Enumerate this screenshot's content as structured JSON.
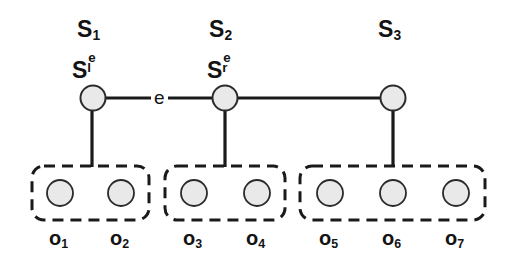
{
  "figure": {
    "background_color": "#ffffff",
    "stroke_color": "#1a1a1a",
    "node_fill_color": "#e9e9e9",
    "node_stroke_color": "#2b2b2b"
  },
  "top_nodes": [
    {
      "id": "node-1",
      "set_label": "S",
      "set_sub": "1",
      "inner_label": "S",
      "inner_sub": "l",
      "inner_sup": "e",
      "cx": 93,
      "cy": 98,
      "r": 12.5
    },
    {
      "id": "node-2",
      "set_label": "S",
      "set_sub": "2",
      "inner_label": "S",
      "inner_sub": "r",
      "inner_sup": "e",
      "cx": 225,
      "cy": 98,
      "r": 12.5
    },
    {
      "id": "node-3",
      "set_label": "S",
      "set_sub": "3",
      "inner_label": "",
      "inner_sub": "",
      "inner_sup": "",
      "cx": 393,
      "cy": 98,
      "r": 12.5
    }
  ],
  "edges": [
    {
      "id": "edge-1-2",
      "label": "e",
      "from": "node-1",
      "to": "node-2",
      "label_x": 158,
      "label_y": 98
    },
    {
      "id": "edge-2-3",
      "label": "",
      "from": "node-2",
      "to": "node-3"
    }
  ],
  "groups": [
    {
      "id": "group-1",
      "x": 32,
      "y": 166,
      "width": 117,
      "height": 54,
      "connector_x": 92,
      "leaves": [
        {
          "label": "o",
          "sub": "1",
          "cx": 60,
          "cy": 193,
          "r": 13,
          "label_x": 60,
          "label_y": 238
        },
        {
          "label": "o",
          "sub": "2",
          "cx": 121,
          "cy": 193,
          "r": 13,
          "label_x": 121,
          "label_y": 238
        }
      ]
    },
    {
      "id": "group-2",
      "x": 165,
      "y": 166,
      "width": 120,
      "height": 54,
      "connector_x": 225,
      "leaves": [
        {
          "label": "o",
          "sub": "3",
          "cx": 194,
          "cy": 193,
          "r": 13,
          "label_x": 194,
          "label_y": 238
        },
        {
          "label": "o",
          "sub": "4",
          "cx": 257,
          "cy": 193,
          "r": 13,
          "label_x": 257,
          "label_y": 238
        }
      ]
    },
    {
      "id": "group-3",
      "x": 300,
      "y": 166,
      "width": 185,
      "height": 54,
      "connector_x": 393,
      "leaves": [
        {
          "label": "o",
          "sub": "5",
          "cx": 330,
          "cy": 193,
          "r": 13,
          "label_x": 330,
          "label_y": 238
        },
        {
          "label": "o",
          "sub": "6",
          "cx": 393,
          "cy": 193,
          "r": 13,
          "label_x": 393,
          "label_y": 238
        },
        {
          "label": "o",
          "sub": "7",
          "cx": 456,
          "cy": 193,
          "r": 13,
          "label_x": 456,
          "label_y": 238
        }
      ]
    }
  ],
  "set_label_positions": [
    {
      "x": 77,
      "y": 18
    },
    {
      "x": 209,
      "y": 18
    },
    {
      "x": 378,
      "y": 18
    }
  ],
  "inner_label_positions": [
    {
      "x": 72,
      "y": 55
    },
    {
      "x": 207,
      "y": 55
    }
  ]
}
